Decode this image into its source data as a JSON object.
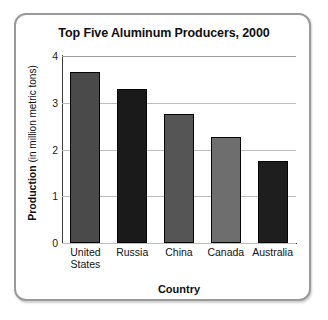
{
  "chart_data": {
    "type": "bar",
    "title": "Top Five Aluminum Producers, 2000",
    "xlabel": "Country",
    "ylabel_strong": "Production",
    "ylabel_rest": " (in million metric tons)",
    "ylabel_full": "Production (in million metric tons)",
    "categories": [
      "United States",
      "Russia",
      "China",
      "Canada",
      "Australia"
    ],
    "category_lines": [
      [
        "United",
        "States"
      ],
      [
        "Russia"
      ],
      [
        "China"
      ],
      [
        "Canada"
      ],
      [
        "Australia"
      ]
    ],
    "values": [
      3.65,
      3.3,
      2.75,
      2.27,
      1.75
    ],
    "bar_colors": [
      "#4a4a4a",
      "#1a1a1a",
      "#555555",
      "#6e6e6e",
      "#1e1e1e"
    ],
    "ylim": [
      0,
      4
    ],
    "yticks": [
      4,
      3,
      2,
      1,
      0
    ],
    "ytick_labels": [
      "4",
      "3",
      "2",
      "1",
      "0"
    ],
    "grid": true,
    "legend": "none",
    "series": [
      {
        "name": "Production (in million metric tons)",
        "values": [
          3.65,
          3.3,
          2.75,
          2.27,
          1.75
        ]
      }
    ]
  }
}
